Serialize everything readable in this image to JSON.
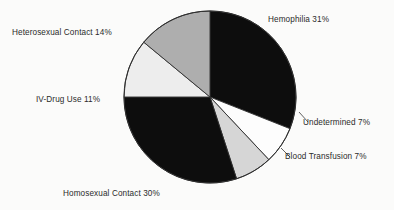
{
  "figure": {
    "kind": "pie-chart",
    "background_color": "#fbfbfa"
  },
  "chart_data": {
    "type": "pie",
    "title": "",
    "xlabel": "",
    "ylabel": "",
    "legend_position": "none",
    "labels_placement": "outside-callout",
    "start_angle_deg": 0,
    "direction": "clockwise",
    "center": {
      "x": 210,
      "y": 97
    },
    "radius": 86,
    "categories": [
      "Hemophilia",
      "Undetermined",
      "Blood Transfusion",
      "Homosexual Contact",
      "IV-Drug Use",
      "Heterosexual Contact"
    ],
    "values": [
      31,
      7,
      7,
      30,
      11,
      14
    ],
    "units": "percent",
    "total": 100,
    "slice_colors": [
      "#0d0d0d",
      "#fdfdfd",
      "#d6d6d6",
      "#0d0d0d",
      "#ededed",
      "#aeaeae"
    ],
    "slices": [
      {
        "label": "Hemophilia",
        "value": 31,
        "text": "Hemophilia 31%",
        "color": "#0d0d0d",
        "start_deg": 0,
        "end_deg": 111.6
      },
      {
        "label": "Undetermined",
        "value": 7,
        "text": "Undetermined 7%",
        "color": "#fdfdfd",
        "start_deg": 111.6,
        "end_deg": 136.8
      },
      {
        "label": "Blood Transfusion",
        "value": 7,
        "text": "Blood Transfusion 7%",
        "color": "#d6d6d6",
        "start_deg": 136.8,
        "end_deg": 162.0
      },
      {
        "label": "Homosexual Contact",
        "value": 30,
        "text": "Homosexual Contact 30%",
        "color": "#0d0d0d",
        "start_deg": 162.0,
        "end_deg": 270.0
      },
      {
        "label": "IV-Drug Use",
        "value": 11,
        "text": "IV-Drug Use 11%",
        "color": "#ededed",
        "start_deg": 270.0,
        "end_deg": 309.6
      },
      {
        "label": "Heterosexual Contact",
        "value": 14,
        "text": "Heterosexual Contact 14%",
        "color": "#aeaeae",
        "start_deg": 309.6,
        "end_deg": 360.0
      }
    ]
  },
  "labels": {
    "hemophilia": "Hemophilia 31%",
    "heterosexual": "Heterosexual Contact 14%",
    "ivdrug": "IV-Drug Use 11%",
    "undetermined": "Undetermined 7%",
    "bloodtransfusion": "Blood Transfusion 7%",
    "homosexual": "Homosexual Contact 30%"
  }
}
